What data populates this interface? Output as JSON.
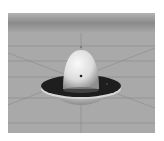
{
  "image": {
    "subject": "3D render of a saucer-shaped object (dome on a flat disk) above a grid floor",
    "colors": {
      "background": "#ffffff",
      "floor": "#a9a9a9",
      "horizon": "#8c8c8c",
      "grid_line": "#8a8a8a",
      "disk_top": "#1e1e1e",
      "disk_rim": "#d8d8d8",
      "dome_light": "#f2f2f2",
      "dome_shadow": "#9a9a9a"
    }
  }
}
